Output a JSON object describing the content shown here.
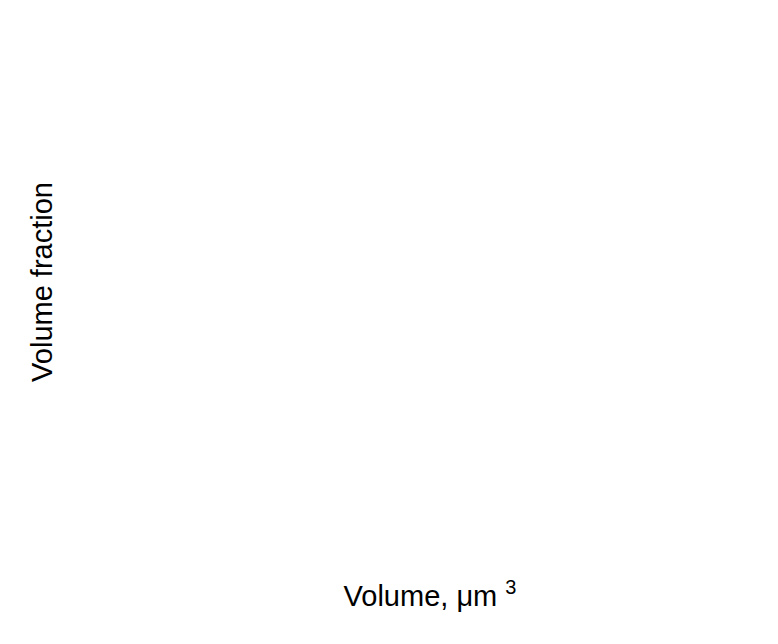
{
  "figure": {
    "background": "#ffffff",
    "axis_color": "#000000",
    "text_color": "#000000"
  },
  "chart_data": {
    "type": "line",
    "title": "",
    "xlabel": "Volume, μm³",
    "xlabel_base": "Volume, μm",
    "xlabel_sup": "3",
    "ylabel": "Volume fraction",
    "xlim": [
      48.3,
      200
    ],
    "ylim": [
      0,
      0.025
    ],
    "x_major_ticks": [
      60,
      80,
      100,
      120,
      140,
      160,
      180,
      200
    ],
    "x_tick_labels": [
      "60",
      "80",
      "100",
      "120",
      "140",
      "160",
      "180",
      "200"
    ],
    "x_minor_ticks": [
      50,
      70,
      90,
      110,
      130,
      150,
      170,
      190
    ],
    "y_major_ticks": [
      0,
      0.005,
      0.01,
      0.015,
      0.02,
      0.025
    ],
    "y_tick_labels": [
      "0.000",
      "0.005",
      "0.010",
      "0.015",
      "0.020",
      "0.025"
    ],
    "y_minor_ticks": [
      0.0025,
      0.0075,
      0.0125,
      0.0175,
      0.0225
    ],
    "grid": false,
    "legend": "none",
    "line_color": "#1a1a1a",
    "line_width": 2.2,
    "series": [
      {
        "name": "volume-fraction-distribution",
        "points": [
          [
            48.3,
            0.00015
          ],
          [
            50,
            0.00018
          ],
          [
            52,
            0.0002
          ],
          [
            54,
            0.00026
          ],
          [
            56,
            0.00035
          ],
          [
            58,
            0.0006
          ],
          [
            60,
            0.00106
          ],
          [
            62,
            0.0018
          ],
          [
            64,
            0.0026
          ],
          [
            66,
            0.0034
          ],
          [
            68,
            0.0043
          ],
          [
            70,
            0.0049
          ],
          [
            71,
            0.0063
          ],
          [
            72,
            0.0098
          ],
          [
            72.5,
            0.0113
          ],
          [
            73,
            0.0128
          ],
          [
            74,
            0.0143
          ],
          [
            75,
            0.0152
          ],
          [
            76.5,
            0.0167
          ],
          [
            78,
            0.0183
          ],
          [
            79.5,
            0.0199
          ],
          [
            81,
            0.0209
          ],
          [
            82.5,
            0.0221
          ],
          [
            84,
            0.0233
          ],
          [
            84.5,
            0.0236
          ],
          [
            85,
            0.0237
          ],
          [
            85.5,
            0.0236
          ],
          [
            86,
            0.0233
          ],
          [
            87.5,
            0.0224
          ],
          [
            89,
            0.0213
          ],
          [
            90.5,
            0.021
          ],
          [
            92,
            0.0206
          ],
          [
            93.5,
            0.0197
          ],
          [
            95,
            0.0186
          ],
          [
            96.5,
            0.0172
          ],
          [
            98,
            0.0156
          ],
          [
            99.5,
            0.0134
          ],
          [
            101,
            0.0113
          ],
          [
            102.5,
            0.01
          ],
          [
            104,
            0.0091
          ],
          [
            106,
            0.0082
          ],
          [
            108,
            0.0076
          ],
          [
            110,
            0.0071
          ],
          [
            113,
            0.0065
          ],
          [
            115.5,
            0.0061
          ],
          [
            118,
            0.0058
          ],
          [
            120.5,
            0.0055
          ],
          [
            123,
            0.0052
          ],
          [
            125.5,
            0.0053
          ],
          [
            128,
            0.0054
          ],
          [
            130.5,
            0.0052
          ],
          [
            133,
            0.0051
          ],
          [
            135.5,
            0.0052
          ],
          [
            138,
            0.0053
          ],
          [
            140.5,
            0.0049
          ],
          [
            143,
            0.0045
          ],
          [
            145.5,
            0.0049
          ],
          [
            148,
            0.0052
          ],
          [
            150.5,
            0.0047
          ],
          [
            153,
            0.0042
          ],
          [
            155.5,
            0.0037
          ],
          [
            158,
            0.0033
          ],
          [
            160.5,
            0.0033
          ],
          [
            163,
            0.0034
          ],
          [
            165.5,
            0.0034
          ],
          [
            168,
            0.0035
          ],
          [
            170.5,
            0.0029
          ],
          [
            173,
            0.0024
          ],
          [
            175.5,
            0.0021
          ],
          [
            178,
            0.0019
          ],
          [
            180.5,
            0.0016
          ],
          [
            183,
            0.0014
          ],
          [
            185.5,
            0.0013
          ],
          [
            188,
            0.0012
          ],
          [
            190.5,
            0.0009
          ],
          [
            193,
            0.0007
          ],
          [
            195.5,
            0.00068
          ],
          [
            198,
            0.00066
          ],
          [
            200,
            0.00068
          ]
        ]
      }
    ]
  }
}
